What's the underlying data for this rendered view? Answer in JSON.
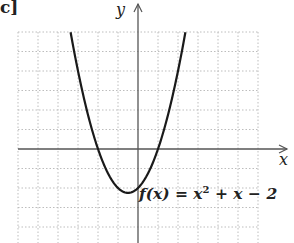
{
  "figure": {
    "part_label": "c]",
    "function_label": "f(x) = x² + x − 2",
    "function_label_parts": {
      "lhs": "f(x)",
      "eq": " = ",
      "t1": "x",
      "t1_exp": "2",
      "rest": " + x − 2"
    }
  },
  "chart_data": {
    "type": "line",
    "title": "",
    "xlabel": "x",
    "ylabel": "y",
    "function": "f(x) = x^2 + x - 2",
    "xlim": [
      -6,
      6
    ],
    "ylim": [
      -4.8,
      6
    ],
    "grid": true,
    "grid_style": "dotted",
    "grid_step": 1,
    "tick_labels_shown": false,
    "roots": [
      -2,
      1
    ],
    "vertex": [
      -0.5,
      -2.25
    ],
    "y_intercept": -2,
    "series": [
      {
        "name": "f(x) = x² + x − 2",
        "x": [
          -3.37,
          -3,
          -2.5,
          -2,
          -1.5,
          -1,
          -0.5,
          0,
          0.5,
          1,
          1.5,
          2,
          2.37
        ],
        "y": [
          6,
          4,
          1.75,
          0,
          -1.25,
          -2,
          -2.25,
          -2,
          -1.25,
          0,
          1.75,
          4,
          6
        ]
      }
    ]
  }
}
